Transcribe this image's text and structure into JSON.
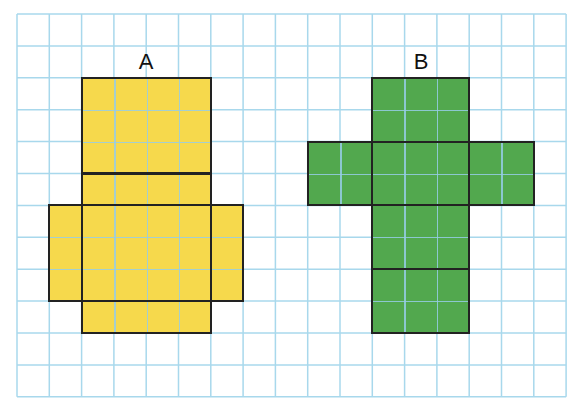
{
  "canvas": {
    "width": 579,
    "height": 412
  },
  "grid": {
    "origin_x": 17,
    "origin_y": 14,
    "cell_w": 32.3,
    "cell_h": 31.9,
    "cols": 17,
    "rows": 12,
    "line_color": "#a8d8ec"
  },
  "nets": [
    {
      "id": "A",
      "label": "A",
      "label_pos": {
        "x": 146,
        "y": 62
      },
      "fill": "#f6d94c",
      "faces": [
        {
          "name": "top-face",
          "col": 2,
          "row": 2,
          "w": 4,
          "h": 3
        },
        {
          "name": "upper-strip-face",
          "col": 2,
          "row": 5,
          "w": 4,
          "h": 1
        },
        {
          "name": "center-face",
          "col": 2,
          "row": 6,
          "w": 4,
          "h": 3
        },
        {
          "name": "left-flap-face",
          "col": 1,
          "row": 6,
          "w": 1,
          "h": 3
        },
        {
          "name": "right-flap-face",
          "col": 6,
          "row": 6,
          "w": 1,
          "h": 3
        },
        {
          "name": "bottom-strip-face",
          "col": 2,
          "row": 9,
          "w": 4,
          "h": 1
        }
      ]
    },
    {
      "id": "B",
      "label": "B",
      "label_pos": {
        "x": 421,
        "y": 62
      },
      "fill": "#52a84e",
      "faces": [
        {
          "name": "top-face",
          "col": 11,
          "row": 2,
          "w": 3,
          "h": 2
        },
        {
          "name": "left-flap-face",
          "col": 9,
          "row": 4,
          "w": 2,
          "h": 2
        },
        {
          "name": "center-face",
          "col": 11,
          "row": 4,
          "w": 3,
          "h": 2
        },
        {
          "name": "right-flap-face",
          "col": 14,
          "row": 4,
          "w": 2,
          "h": 2
        },
        {
          "name": "lower-face",
          "col": 11,
          "row": 6,
          "w": 3,
          "h": 2
        },
        {
          "name": "bottom-face",
          "col": 11,
          "row": 8,
          "w": 3,
          "h": 2
        }
      ]
    }
  ]
}
